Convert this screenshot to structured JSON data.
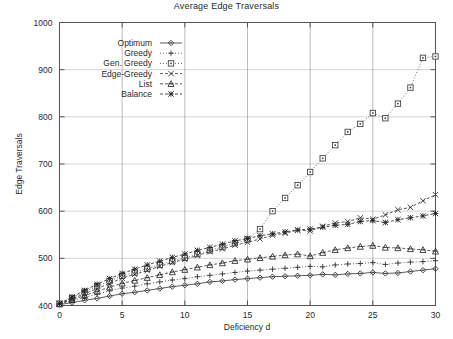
{
  "chart_data": {
    "type": "line",
    "title": "Average Edge Traversals",
    "xlabel": "Deficiency d",
    "ylabel": "Edge Traversals",
    "xlim": [
      0,
      30
    ],
    "ylim": [
      400,
      1000
    ],
    "xticks": [
      0,
      5,
      10,
      15,
      20,
      25,
      30
    ],
    "yticks": [
      400,
      500,
      600,
      700,
      800,
      900,
      1000
    ],
    "grid": true,
    "legend_position": "upper-left-inset",
    "x": [
      0,
      1,
      2,
      3,
      4,
      5,
      6,
      7,
      8,
      9,
      10,
      11,
      12,
      13,
      14,
      15,
      16,
      17,
      18,
      19,
      20,
      21,
      22,
      23,
      24,
      25,
      26,
      27,
      28,
      29,
      30
    ],
    "series": [
      {
        "name": "Optimum",
        "marker": "diamond",
        "linestyle": "solid",
        "color": "#333333",
        "values": [
          402,
          406,
          411,
          415,
          420,
          425,
          428,
          432,
          436,
          440,
          443,
          446,
          450,
          452,
          455,
          457,
          459,
          461,
          462,
          463,
          464,
          466,
          465,
          467,
          468,
          470,
          468,
          469,
          472,
          475,
          478
        ]
      },
      {
        "name": "Greedy",
        "marker": "plus",
        "linestyle": "dotted",
        "color": "#333333",
        "values": [
          403,
          410,
          417,
          424,
          431,
          437,
          441,
          446,
          450,
          454,
          457,
          461,
          464,
          467,
          470,
          473,
          475,
          477,
          479,
          481,
          483,
          482,
          486,
          488,
          489,
          491,
          487,
          490,
          492,
          493,
          495
        ]
      },
      {
        "name": "Gen. Greedy",
        "marker": "square",
        "linestyle": "dotted",
        "color": "#444444",
        "values": [
          404,
          416,
          429,
          441,
          452,
          463,
          470,
          478,
          486,
          494,
          501,
          509,
          517,
          524,
          532,
          540,
          562,
          600,
          628,
          655,
          683,
          712,
          740,
          768,
          785,
          808,
          797,
          828,
          862,
          925,
          928
        ]
      },
      {
        "name": "Edge-Greedy",
        "marker": "cross",
        "linestyle": "dashed",
        "color": "#333333",
        "values": [
          404,
          414,
          425,
          436,
          447,
          458,
          466,
          474,
          483,
          491,
          498,
          506,
          514,
          520,
          528,
          534,
          541,
          549,
          553,
          560,
          558,
          568,
          575,
          578,
          586,
          583,
          592,
          603,
          608,
          622,
          635
        ]
      },
      {
        "name": "List",
        "marker": "triangle",
        "linestyle": "dashed",
        "color": "#333333",
        "values": [
          403,
          412,
          421,
          430,
          439,
          447,
          453,
          459,
          465,
          471,
          476,
          481,
          486,
          490,
          495,
          498,
          501,
          504,
          507,
          509,
          505,
          512,
          518,
          522,
          525,
          527,
          523,
          522,
          520,
          518,
          515
        ]
      },
      {
        "name": "Balance",
        "marker": "star",
        "linestyle": "dashed",
        "color": "#222222",
        "values": [
          404,
          418,
          432,
          445,
          457,
          468,
          477,
          486,
          494,
          502,
          509,
          517,
          523,
          530,
          537,
          542,
          548,
          552,
          556,
          560,
          562,
          566,
          570,
          572,
          578,
          580,
          576,
          582,
          586,
          590,
          595
        ]
      }
    ]
  },
  "legend": {
    "entries": [
      "Optimum",
      "Greedy",
      "Gen. Greedy",
      "Edge-Greedy",
      "List",
      "Balance"
    ]
  }
}
